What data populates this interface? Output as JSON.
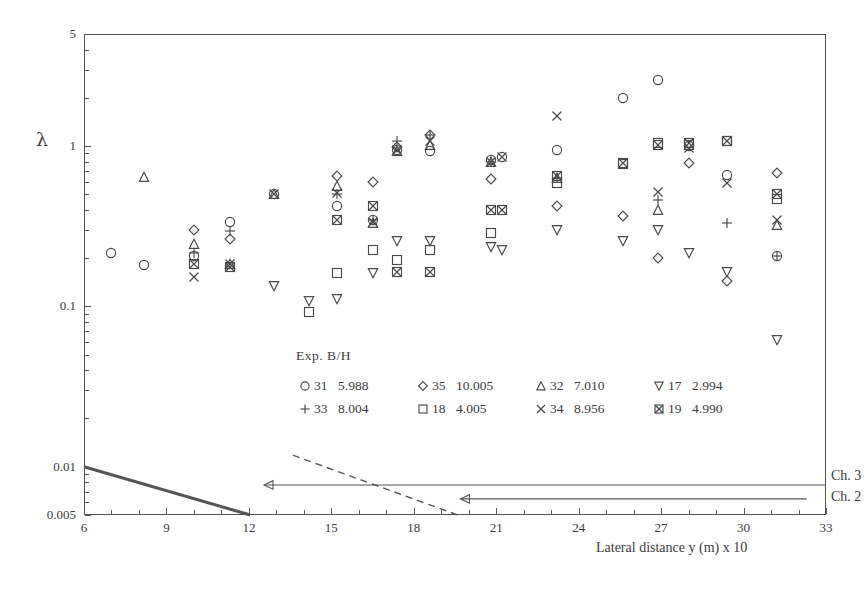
{
  "figure": {
    "ylabel": "λ",
    "xlabel": "Lateral distance   y   (m) x 10"
  },
  "legend": {
    "title": "Exp.   B/H",
    "entries": [
      {
        "symbol": "circle",
        "exp": "31",
        "bh": "5.988"
      },
      {
        "symbol": "plus",
        "exp": "33",
        "bh": "8.004"
      },
      {
        "symbol": "diamond",
        "exp": "35",
        "bh": "10.005"
      },
      {
        "symbol": "square",
        "exp": "18",
        "bh": "4.005"
      },
      {
        "symbol": "triangle-up",
        "exp": "32",
        "bh": "7.010"
      },
      {
        "symbol": "cross",
        "exp": "34",
        "bh": "8.956"
      },
      {
        "symbol": "triangle-down",
        "exp": "17",
        "bh": "2.994"
      },
      {
        "symbol": "crossed-square",
        "exp": "19",
        "bh": "4.990"
      }
    ]
  },
  "annotations": {
    "ch3": "Ch. 3",
    "ch2": "Ch. 2"
  },
  "chart_data": {
    "type": "scatter",
    "title": "",
    "xlabel": "Lateral distance   y   (m) x 10",
    "ylabel": "λ",
    "xlim": [
      6,
      33
    ],
    "ylim": [
      0.005,
      5
    ],
    "yscale": "log",
    "xscale": "linear",
    "grid": false,
    "legend_position": "inside-center-bottom",
    "xticks": [
      6,
      9,
      12,
      15,
      18,
      21,
      24,
      27,
      30,
      33
    ],
    "yticks": [
      0.005,
      0.01,
      0.1,
      1,
      5
    ],
    "ytick_labels": [
      "0.005",
      "0.01",
      "0.1",
      "1",
      "5"
    ],
    "series": [
      {
        "name": "31",
        "bh": 5.988,
        "symbol": "circle",
        "x": [
          7.0,
          8.2,
          10.0,
          11.3,
          12.9,
          15.2,
          16.5,
          17.4,
          18.6,
          20.8,
          21.2,
          23.2,
          25.6,
          26.9,
          28.0,
          29.4,
          31.2
        ],
        "y": [
          0.215,
          0.181,
          0.205,
          0.335,
          0.505,
          0.425,
          0.345,
          0.95,
          0.93,
          0.82,
          0.86,
          0.95,
          2.0,
          2.6,
          1.0,
          0.66,
          0.205
        ]
      },
      {
        "name": "32",
        "bh": 7.01,
        "symbol": "triangle-up",
        "x": [
          8.2,
          10.0,
          11.3,
          12.9,
          15.2,
          16.5,
          17.4,
          18.6,
          20.8,
          23.2,
          26.9,
          31.2
        ],
        "y": [
          0.645,
          0.245,
          0.185,
          0.5,
          0.56,
          0.33,
          0.93,
          1.02,
          0.8,
          0.63,
          0.4,
          0.32
        ]
      },
      {
        "name": "33",
        "bh": 8.004,
        "symbol": "plus",
        "x": [
          10.0,
          11.3,
          15.2,
          16.5,
          17.4,
          18.6,
          20.8,
          23.2,
          26.9,
          29.4,
          31.2
        ],
        "y": [
          0.215,
          0.295,
          0.505,
          0.345,
          1.08,
          1.18,
          0.8,
          0.63,
          0.46,
          0.33,
          0.205
        ]
      },
      {
        "name": "34",
        "bh": 8.956,
        "symbol": "cross",
        "x": [
          10.0,
          11.3,
          12.9,
          15.2,
          16.5,
          17.4,
          18.6,
          20.8,
          21.2,
          23.2,
          26.9,
          28.0,
          29.4,
          31.2
        ],
        "y": [
          0.152,
          0.185,
          0.5,
          0.51,
          0.335,
          0.95,
          1.07,
          0.8,
          0.86,
          1.55,
          0.52,
          0.97,
          0.585,
          0.345
        ]
      },
      {
        "name": "35",
        "bh": 10.005,
        "symbol": "diamond",
        "x": [
          10.0,
          11.3,
          15.2,
          16.5,
          17.4,
          18.6,
          20.8,
          23.2,
          25.6,
          26.9,
          28.0,
          29.4,
          31.2
        ],
        "y": [
          0.3,
          0.265,
          0.65,
          0.6,
          0.98,
          1.18,
          0.62,
          0.42,
          0.365,
          0.2,
          0.78,
          0.145,
          0.68
        ]
      },
      {
        "name": "17",
        "bh": 2.994,
        "symbol": "triangle-down",
        "x": [
          12.9,
          14.2,
          15.2,
          16.5,
          17.4,
          18.6,
          20.8,
          21.2,
          23.2,
          25.6,
          26.9,
          28.0,
          29.4,
          31.2
        ],
        "y": [
          0.135,
          0.108,
          0.112,
          0.162,
          0.255,
          0.255,
          0.235,
          0.225,
          0.3,
          0.255,
          0.3,
          0.215,
          0.165,
          0.062
        ]
      },
      {
        "name": "18",
        "bh": 4.005,
        "symbol": "square",
        "x": [
          14.2,
          15.2,
          16.5,
          17.4,
          18.6,
          20.8,
          23.2,
          25.6,
          26.9,
          28.0,
          29.4,
          31.2
        ],
        "y": [
          0.092,
          0.162,
          0.225,
          0.195,
          0.225,
          0.285,
          0.585,
          0.77,
          1.04,
          1.02,
          1.07,
          0.47
        ]
      },
      {
        "name": "19",
        "bh": 4.99,
        "symbol": "crossed-square",
        "x": [
          10.0,
          11.3,
          15.2,
          16.5,
          17.4,
          18.6,
          20.8,
          21.2,
          23.2,
          25.6,
          26.9,
          28.0,
          29.4,
          31.2
        ],
        "y": [
          0.185,
          0.175,
          0.345,
          0.425,
          0.165,
          0.165,
          0.4,
          0.4,
          0.655,
          0.78,
          1.01,
          1.05,
          1.07,
          0.5
        ]
      }
    ],
    "reference_lines": [
      {
        "name": "solid-reference",
        "style": "solid",
        "points": [
          [
            6,
            0.01
          ],
          [
            12.05,
            0.005
          ]
        ]
      },
      {
        "name": "dashed-reference",
        "style": "dashed",
        "points": [
          [
            13.6,
            0.0118
          ],
          [
            19.6,
            0.005
          ]
        ]
      }
    ],
    "arrow_annotations": [
      {
        "label": "Ch. 3",
        "y": 0.0077,
        "x_from": 33.0,
        "x_to": 12.55
      },
      {
        "label": "Ch. 2",
        "y": 0.0063,
        "x_from": 32.3,
        "x_to": 19.7
      }
    ]
  }
}
